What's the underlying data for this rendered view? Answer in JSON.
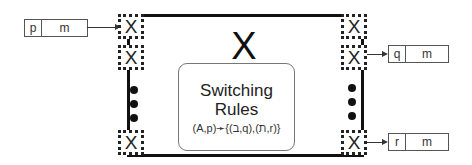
{
  "diagram": {
    "component": {
      "label": "X"
    },
    "rules_box": {
      "title_line1": "Switching",
      "title_line2": "Rules",
      "formula": "(A,p)➛{(ב,q),(ת,r)}"
    },
    "ports": {
      "left": [
        "X",
        "X",
        "X"
      ],
      "right": [
        "X",
        "X",
        "X"
      ],
      "ellipsis_dots": 3
    },
    "messages": {
      "input": {
        "header": "p",
        "body": "m"
      },
      "output_1": {
        "header": "q",
        "body": "m"
      },
      "output_2": {
        "header": "r",
        "body": "m"
      }
    }
  }
}
